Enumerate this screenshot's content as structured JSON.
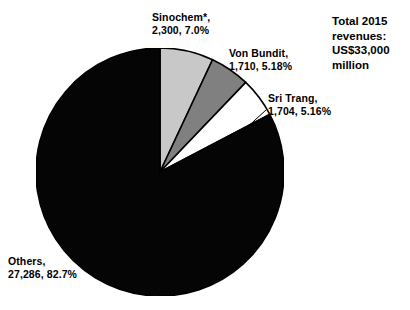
{
  "title_block": {
    "line1": "Total 2015",
    "line2": "revenues:",
    "line3": "US$33,000",
    "line4": "million"
  },
  "labels": {
    "sinochem": {
      "line1": "Sinochem*,",
      "line2": "2,300, 7.0%"
    },
    "vonbundit": {
      "line1": "Von Bundit,",
      "line2": "1,710, 5.18%"
    },
    "sritrang": {
      "line1": "Sri Trang,",
      "line2": "1,704, 5.16%"
    },
    "others": {
      "line1": "Others,",
      "line2": "27,286, 82.7%"
    }
  },
  "chart_data": {
    "type": "pie",
    "title": "Total 2015 revenues: US$33,000 million",
    "categories": [
      "Sinochem*",
      "Von Bundit",
      "Sri Trang",
      "Others"
    ],
    "values": [
      2300,
      1710,
      1704,
      27286
    ],
    "percentages": [
      7.0,
      5.18,
      5.16,
      82.7
    ],
    "value_labels": [
      "2,300",
      "1,710",
      "1,704",
      "27,286"
    ],
    "percent_labels": [
      "7.0%",
      "5.18%",
      "5.16%",
      "82.7%"
    ],
    "colors": [
      "#c8c8c8",
      "#808080",
      "#ffffff",
      "#050505"
    ],
    "stroke_color": "#000000",
    "units": "US$ million",
    "total": 33000,
    "total_label": "US$33,000 million",
    "start_angle_deg": 0,
    "direction": "clockwise",
    "legend": "none",
    "grid": false,
    "footnote_marker": "*"
  }
}
